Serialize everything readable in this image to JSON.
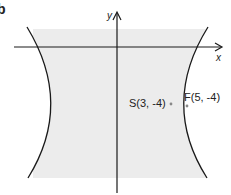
{
  "figure": {
    "part_label": "b",
    "axes": {
      "x_label": "x",
      "y_label": "y"
    },
    "curve": {
      "type": "hyperbola",
      "orientation": "horizontal transverse axis",
      "shaded": "region between branches"
    },
    "points": [
      {
        "name": "S",
        "label": "S(3, -4)",
        "x": 3,
        "y": -4,
        "role": "vertex"
      },
      {
        "name": "F",
        "label": "F(5, -4)",
        "x": 5,
        "y": -4,
        "role": "focus"
      }
    ],
    "colors": {
      "shade": "#ececec",
      "line": "#1a1a1a",
      "point": "#888888"
    }
  }
}
